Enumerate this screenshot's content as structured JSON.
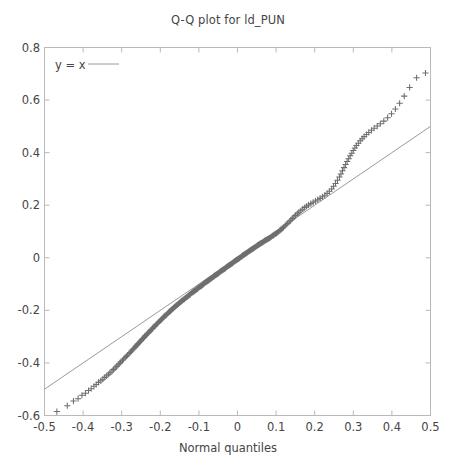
{
  "figure": {
    "title": "Q-Q plot for ld_PUN",
    "xlabel": "Normal quantiles",
    "ylabel": "",
    "legend_label": "y = x",
    "background": "#ffffff",
    "frame_color": "#b9b9b9",
    "marker_color": "#6e6e6e",
    "line_color": "#9a9a9a",
    "text_color": "#454545"
  },
  "chart_data": {
    "type": "scatter",
    "title": "Q-Q plot for ld_PUN",
    "xlabel": "Normal quantiles",
    "ylabel": "",
    "xlim": [
      -0.5,
      0.5
    ],
    "ylim": [
      -0.6,
      0.8
    ],
    "xticks": [
      -0.5,
      -0.4,
      -0.3,
      -0.2,
      -0.1,
      0,
      0.1,
      0.2,
      0.3,
      0.4,
      0.5
    ],
    "yticks": [
      -0.6,
      -0.4,
      -0.2,
      0,
      0.2,
      0.4,
      0.6,
      0.8
    ],
    "xtick_labels": [
      "-0.5",
      "-0.4",
      "-0.3",
      "-0.2",
      "-0.1",
      "0",
      "0.1",
      "0.2",
      "0.3",
      "0.4",
      "0.5"
    ],
    "ytick_labels": [
      "-0.6",
      "-0.4",
      "-0.2",
      "0",
      "0.2",
      "0.4",
      "0.6",
      "0.8"
    ],
    "grid": false,
    "legend_position": "top-left",
    "series": [
      {
        "name": "sample quantiles",
        "marker": "plus",
        "color": "#6e6e6e",
        "points": [
          [
            -0.468,
            -0.585
          ],
          [
            -0.441,
            -0.563
          ],
          [
            -0.425,
            -0.545
          ],
          [
            -0.413,
            -0.536
          ],
          [
            -0.403,
            -0.523
          ],
          [
            -0.394,
            -0.515
          ],
          [
            -0.386,
            -0.505
          ],
          [
            -0.379,
            -0.498
          ],
          [
            -0.372,
            -0.489
          ],
          [
            -0.366,
            -0.482
          ],
          [
            -0.36,
            -0.474
          ],
          [
            -0.354,
            -0.468
          ],
          [
            -0.349,
            -0.462
          ],
          [
            -0.344,
            -0.455
          ],
          [
            -0.339,
            -0.449
          ],
          [
            -0.334,
            -0.443
          ],
          [
            -0.33,
            -0.437
          ],
          [
            -0.325,
            -0.431
          ],
          [
            -0.321,
            -0.425
          ],
          [
            -0.317,
            -0.419
          ],
          [
            -0.313,
            -0.413
          ],
          [
            -0.309,
            -0.407
          ],
          [
            -0.305,
            -0.401
          ],
          [
            -0.302,
            -0.396
          ],
          [
            -0.298,
            -0.39
          ],
          [
            -0.295,
            -0.385
          ],
          [
            -0.291,
            -0.38
          ],
          [
            -0.288,
            -0.375
          ],
          [
            -0.285,
            -0.37
          ],
          [
            -0.281,
            -0.365
          ],
          [
            -0.278,
            -0.36
          ],
          [
            -0.275,
            -0.355
          ],
          [
            -0.272,
            -0.35
          ],
          [
            -0.269,
            -0.345
          ],
          [
            -0.266,
            -0.341
          ],
          [
            -0.263,
            -0.336
          ],
          [
            -0.26,
            -0.332
          ],
          [
            -0.258,
            -0.327
          ],
          [
            -0.255,
            -0.323
          ],
          [
            -0.252,
            -0.318
          ],
          [
            -0.249,
            -0.314
          ],
          [
            -0.247,
            -0.31
          ],
          [
            -0.244,
            -0.306
          ],
          [
            -0.241,
            -0.301
          ],
          [
            -0.239,
            -0.297
          ],
          [
            -0.236,
            -0.293
          ],
          [
            -0.234,
            -0.289
          ],
          [
            -0.231,
            -0.286
          ],
          [
            -0.229,
            -0.282
          ],
          [
            -0.226,
            -0.278
          ],
          [
            -0.224,
            -0.274
          ],
          [
            -0.221,
            -0.271
          ],
          [
            -0.219,
            -0.267
          ],
          [
            -0.217,
            -0.263
          ],
          [
            -0.214,
            -0.26
          ],
          [
            -0.212,
            -0.256
          ],
          [
            -0.21,
            -0.253
          ],
          [
            -0.207,
            -0.25
          ],
          [
            -0.205,
            -0.246
          ],
          [
            -0.203,
            -0.243
          ],
          [
            -0.201,
            -0.24
          ],
          [
            -0.198,
            -0.236
          ],
          [
            -0.196,
            -0.233
          ],
          [
            -0.194,
            -0.23
          ],
          [
            -0.192,
            -0.227
          ],
          [
            -0.19,
            -0.224
          ],
          [
            -0.188,
            -0.221
          ],
          [
            -0.185,
            -0.218
          ],
          [
            -0.183,
            -0.215
          ],
          [
            -0.181,
            -0.212
          ],
          [
            -0.179,
            -0.209
          ],
          [
            -0.177,
            -0.206
          ],
          [
            -0.175,
            -0.204
          ],
          [
            -0.173,
            -0.201
          ],
          [
            -0.171,
            -0.198
          ],
          [
            -0.169,
            -0.195
          ],
          [
            -0.167,
            -0.193
          ],
          [
            -0.165,
            -0.19
          ],
          [
            -0.163,
            -0.188
          ],
          [
            -0.161,
            -0.185
          ],
          [
            -0.159,
            -0.182
          ],
          [
            -0.157,
            -0.18
          ],
          [
            -0.155,
            -0.177
          ],
          [
            -0.153,
            -0.175
          ],
          [
            -0.151,
            -0.172
          ],
          [
            -0.149,
            -0.17
          ],
          [
            -0.147,
            -0.168
          ],
          [
            -0.145,
            -0.165
          ],
          [
            -0.143,
            -0.163
          ],
          [
            -0.141,
            -0.16
          ],
          [
            -0.139,
            -0.158
          ],
          [
            -0.137,
            -0.156
          ],
          [
            -0.135,
            -0.153
          ],
          [
            -0.133,
            -0.151
          ],
          [
            -0.131,
            -0.149
          ],
          [
            -0.129,
            -0.147
          ],
          [
            -0.127,
            -0.144
          ],
          [
            -0.125,
            -0.142
          ],
          [
            -0.123,
            -0.14
          ],
          [
            -0.122,
            -0.138
          ],
          [
            -0.12,
            -0.135
          ],
          [
            -0.118,
            -0.133
          ],
          [
            -0.116,
            -0.131
          ],
          [
            -0.114,
            -0.129
          ],
          [
            -0.112,
            -0.127
          ],
          [
            -0.11,
            -0.125
          ],
          [
            -0.108,
            -0.122
          ],
          [
            -0.106,
            -0.12
          ],
          [
            -0.104,
            -0.118
          ],
          [
            -0.103,
            -0.116
          ],
          [
            -0.101,
            -0.114
          ],
          [
            -0.099,
            -0.112
          ],
          [
            -0.097,
            -0.11
          ],
          [
            -0.095,
            -0.108
          ],
          [
            -0.093,
            -0.106
          ],
          [
            -0.091,
            -0.104
          ],
          [
            -0.089,
            -0.101
          ],
          [
            -0.088,
            -0.099
          ],
          [
            -0.086,
            -0.097
          ],
          [
            -0.084,
            -0.095
          ],
          [
            -0.082,
            -0.093
          ],
          [
            -0.08,
            -0.091
          ],
          [
            -0.078,
            -0.089
          ],
          [
            -0.076,
            -0.087
          ],
          [
            -0.074,
            -0.085
          ],
          [
            -0.073,
            -0.083
          ],
          [
            -0.071,
            -0.081
          ],
          [
            -0.069,
            -0.079
          ],
          [
            -0.067,
            -0.077
          ],
          [
            -0.065,
            -0.075
          ],
          [
            -0.063,
            -0.073
          ],
          [
            -0.061,
            -0.071
          ],
          [
            -0.06,
            -0.069
          ],
          [
            -0.058,
            -0.067
          ],
          [
            -0.056,
            -0.065
          ],
          [
            -0.054,
            -0.063
          ],
          [
            -0.052,
            -0.061
          ],
          [
            -0.05,
            -0.059
          ],
          [
            -0.048,
            -0.057
          ],
          [
            -0.046,
            -0.055
          ],
          [
            -0.045,
            -0.053
          ],
          [
            -0.043,
            -0.051
          ],
          [
            -0.041,
            -0.049
          ],
          [
            -0.039,
            -0.047
          ],
          [
            -0.037,
            -0.045
          ],
          [
            -0.035,
            -0.043
          ],
          [
            -0.033,
            -0.041
          ],
          [
            -0.031,
            -0.039
          ],
          [
            -0.03,
            -0.037
          ],
          [
            -0.028,
            -0.035
          ],
          [
            -0.026,
            -0.033
          ],
          [
            -0.024,
            -0.031
          ],
          [
            -0.022,
            -0.029
          ],
          [
            -0.02,
            -0.027
          ],
          [
            -0.018,
            -0.025
          ],
          [
            -0.016,
            -0.023
          ],
          [
            -0.014,
            -0.021
          ],
          [
            -0.012,
            -0.019
          ],
          [
            -0.011,
            -0.017
          ],
          [
            -0.009,
            -0.015
          ],
          [
            -0.007,
            -0.013
          ],
          [
            -0.005,
            -0.011
          ],
          [
            -0.003,
            -0.009
          ],
          [
            -0.001,
            -0.007
          ],
          [
            0.001,
            -0.005
          ],
          [
            0.003,
            -0.003
          ],
          [
            0.005,
            -0.001
          ],
          [
            0.007,
            0.001
          ],
          [
            0.009,
            0.003
          ],
          [
            0.011,
            0.005
          ],
          [
            0.012,
            0.007
          ],
          [
            0.014,
            0.009
          ],
          [
            0.016,
            0.011
          ],
          [
            0.018,
            0.013
          ],
          [
            0.02,
            0.015
          ],
          [
            0.022,
            0.017
          ],
          [
            0.024,
            0.019
          ],
          [
            0.026,
            0.021
          ],
          [
            0.028,
            0.023
          ],
          [
            0.03,
            0.025
          ],
          [
            0.032,
            0.027
          ],
          [
            0.034,
            0.029
          ],
          [
            0.036,
            0.031
          ],
          [
            0.038,
            0.033
          ],
          [
            0.04,
            0.035
          ],
          [
            0.042,
            0.037
          ],
          [
            0.044,
            0.039
          ],
          [
            0.046,
            0.041
          ],
          [
            0.048,
            0.043
          ],
          [
            0.05,
            0.045
          ],
          [
            0.052,
            0.047
          ],
          [
            0.054,
            0.049
          ],
          [
            0.056,
            0.051
          ],
          [
            0.058,
            0.053
          ],
          [
            0.06,
            0.055
          ],
          [
            0.062,
            0.057
          ],
          [
            0.065,
            0.059
          ],
          [
            0.067,
            0.061
          ],
          [
            0.069,
            0.063
          ],
          [
            0.071,
            0.065
          ],
          [
            0.073,
            0.067
          ],
          [
            0.076,
            0.069
          ],
          [
            0.078,
            0.071
          ],
          [
            0.08,
            0.073
          ],
          [
            0.083,
            0.075
          ],
          [
            0.085,
            0.078
          ],
          [
            0.088,
            0.08
          ],
          [
            0.09,
            0.083
          ],
          [
            0.093,
            0.085
          ],
          [
            0.095,
            0.088
          ],
          [
            0.098,
            0.091
          ],
          [
            0.101,
            0.094
          ],
          [
            0.104,
            0.097
          ],
          [
            0.107,
            0.1
          ],
          [
            0.11,
            0.104
          ],
          [
            0.113,
            0.108
          ],
          [
            0.116,
            0.112
          ],
          [
            0.119,
            0.116
          ],
          [
            0.123,
            0.121
          ],
          [
            0.126,
            0.126
          ],
          [
            0.13,
            0.131
          ],
          [
            0.134,
            0.137
          ],
          [
            0.138,
            0.143
          ],
          [
            0.142,
            0.149
          ],
          [
            0.146,
            0.155
          ],
          [
            0.15,
            0.161
          ],
          [
            0.155,
            0.167
          ],
          [
            0.159,
            0.173
          ],
          [
            0.164,
            0.179
          ],
          [
            0.169,
            0.185
          ],
          [
            0.174,
            0.191
          ],
          [
            0.179,
            0.196
          ],
          [
            0.184,
            0.201
          ],
          [
            0.19,
            0.206
          ],
          [
            0.196,
            0.211
          ],
          [
            0.202,
            0.216
          ],
          [
            0.208,
            0.221
          ],
          [
            0.214,
            0.226
          ],
          [
            0.22,
            0.232
          ],
          [
            0.226,
            0.238
          ],
          [
            0.232,
            0.245
          ],
          [
            0.238,
            0.253
          ],
          [
            0.244,
            0.262
          ],
          [
            0.249,
            0.272
          ],
          [
            0.254,
            0.283
          ],
          [
            0.259,
            0.295
          ],
          [
            0.264,
            0.307
          ],
          [
            0.268,
            0.319
          ],
          [
            0.272,
            0.331
          ],
          [
            0.276,
            0.343
          ],
          [
            0.28,
            0.355
          ],
          [
            0.284,
            0.366
          ],
          [
            0.288,
            0.377
          ],
          [
            0.292,
            0.388
          ],
          [
            0.296,
            0.398
          ],
          [
            0.3,
            0.408
          ],
          [
            0.304,
            0.418
          ],
          [
            0.308,
            0.427
          ],
          [
            0.313,
            0.436
          ],
          [
            0.318,
            0.445
          ],
          [
            0.323,
            0.453
          ],
          [
            0.328,
            0.461
          ],
          [
            0.334,
            0.469
          ],
          [
            0.34,
            0.477
          ],
          [
            0.347,
            0.485
          ],
          [
            0.354,
            0.493
          ],
          [
            0.362,
            0.501
          ],
          [
            0.37,
            0.51
          ],
          [
            0.379,
            0.52
          ],
          [
            0.389,
            0.533
          ],
          [
            0.399,
            0.548
          ],
          [
            0.409,
            0.566
          ],
          [
            0.42,
            0.588
          ],
          [
            0.432,
            0.615
          ],
          [
            0.446,
            0.648
          ],
          [
            0.464,
            0.685
          ],
          [
            0.487,
            0.703
          ]
        ]
      }
    ],
    "reference_line": {
      "name": "y = x",
      "color": "#9a9a9a",
      "from": [
        -0.5,
        -0.5
      ],
      "to": [
        0.5,
        0.5
      ]
    }
  }
}
